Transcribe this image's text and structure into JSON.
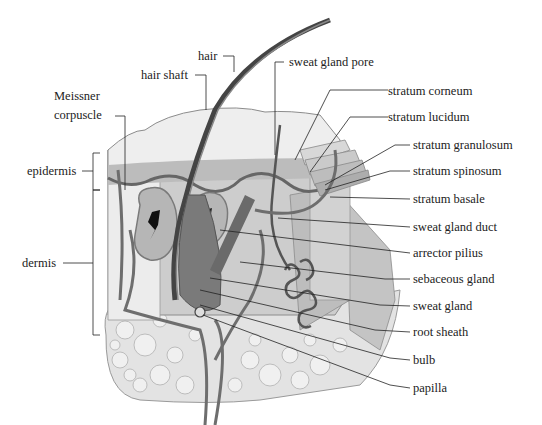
{
  "diagram": {
    "labels_left": [
      {
        "id": "meissner",
        "text_line1": "Meissner",
        "text_line2": "corpuscle"
      },
      {
        "id": "epidermis",
        "text": "epidermis"
      },
      {
        "id": "dermis",
        "text": "dermis"
      }
    ],
    "labels_top": [
      {
        "id": "hair",
        "text": "hair"
      },
      {
        "id": "hair_shaft",
        "text": "hair shaft"
      },
      {
        "id": "sweat_gland_pore",
        "text": "sweat gland pore"
      }
    ],
    "labels_right": [
      {
        "id": "stratum_corneum",
        "text": "stratum corneum"
      },
      {
        "id": "stratum_lucidum",
        "text": "stratum lucidum"
      },
      {
        "id": "stratum_granulosum",
        "text": "stratum granulosum"
      },
      {
        "id": "stratum_spinosum",
        "text": "stratum spinosum"
      },
      {
        "id": "stratum_basale",
        "text": "stratum basale"
      },
      {
        "id": "sweat_gland_duct",
        "text": "sweat gland duct"
      },
      {
        "id": "arrector_pilius",
        "text": "arrector pilius"
      },
      {
        "id": "sebaceous_gland",
        "text": "sebaceous gland"
      },
      {
        "id": "sweat_gland",
        "text": "sweat gland"
      },
      {
        "id": "root_sheath",
        "text": "root sheath"
      },
      {
        "id": "bulb",
        "text": "bulb"
      },
      {
        "id": "papilla",
        "text": "papilla"
      }
    ],
    "colors": {
      "epidermis": "#d9d9d9",
      "dermis": "#c8c8c8",
      "hair": "#555555",
      "vessels": "#6e6e6e",
      "fat": "#e2e2e2",
      "leader": "#222222"
    }
  }
}
